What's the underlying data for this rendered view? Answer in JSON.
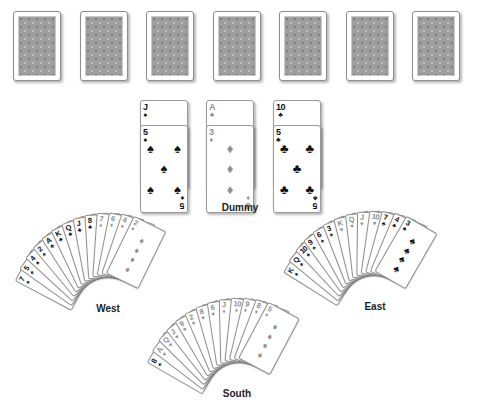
{
  "scene": {
    "title": "Bridge deal layout",
    "background_color": "#ffffff",
    "card_back_color": "#9e9e9e",
    "black_suit_color": "#111111",
    "grey_suit_color": "#909090"
  },
  "suit_glyphs": {
    "spade": "♠",
    "heart": "♥",
    "diamond": "♦",
    "club": "♣"
  },
  "top_row": {
    "name": "face-down-cards",
    "count": 7,
    "cards": [
      {
        "index": 1,
        "face": "down"
      },
      {
        "index": 2,
        "face": "down"
      },
      {
        "index": 3,
        "face": "down"
      },
      {
        "index": 4,
        "face": "down"
      },
      {
        "index": 5,
        "face": "down"
      },
      {
        "index": 6,
        "face": "down"
      },
      {
        "index": 7,
        "face": "down"
      }
    ]
  },
  "dummy": {
    "label": "Dummy",
    "pairs": [
      {
        "back_card": {
          "rank": "J",
          "suit": "spade",
          "color": "black"
        },
        "front_card": {
          "rank": "5",
          "suit": "spade",
          "color": "black",
          "pip_count": 5
        }
      },
      {
        "back_card": {
          "rank": "A",
          "suit": "club",
          "color": "grey"
        },
        "front_card": {
          "rank": "3",
          "suit": "diamond",
          "color": "grey",
          "pip_count": 3
        }
      },
      {
        "back_card": {
          "rank": "10",
          "suit": "club",
          "color": "black"
        },
        "front_card": {
          "rank": "5",
          "suit": "club",
          "color": "black",
          "pip_count": 5
        }
      }
    ]
  },
  "hands": [
    {
      "seat": "West",
      "label": "West",
      "card_count": 13,
      "cards": [
        {
          "rank": "7",
          "suit": "spade",
          "color": "black"
        },
        {
          "rank": "5",
          "suit": "spade",
          "color": "black"
        },
        {
          "rank": "4",
          "suit": "spade",
          "color": "black"
        },
        {
          "rank": "2",
          "suit": "spade",
          "color": "black"
        },
        {
          "rank": "A",
          "suit": "club",
          "color": "black"
        },
        {
          "rank": "K",
          "suit": "club",
          "color": "black"
        },
        {
          "rank": "Q",
          "suit": "club",
          "color": "black"
        },
        {
          "rank": "J",
          "suit": "club",
          "color": "black"
        },
        {
          "rank": "8",
          "suit": "club",
          "color": "black"
        },
        {
          "rank": "7",
          "suit": "diamond",
          "color": "grey"
        },
        {
          "rank": "6",
          "suit": "diamond",
          "color": "grey"
        },
        {
          "rank": "4",
          "suit": "diamond",
          "color": "grey"
        },
        {
          "rank": "2",
          "suit": "diamond",
          "color": "grey"
        }
      ]
    },
    {
      "seat": "East",
      "label": "East",
      "card_count": 13,
      "cards": [
        {
          "rank": "K",
          "suit": "spade",
          "color": "black"
        },
        {
          "rank": "Q",
          "suit": "spade",
          "color": "black"
        },
        {
          "rank": "10",
          "suit": "spade",
          "color": "black"
        },
        {
          "rank": "9",
          "suit": "spade",
          "color": "black"
        },
        {
          "rank": "6",
          "suit": "spade",
          "color": "black"
        },
        {
          "rank": "3",
          "suit": "spade",
          "color": "black"
        },
        {
          "rank": "K",
          "suit": "heart",
          "color": "grey"
        },
        {
          "rank": "Q",
          "suit": "heart",
          "color": "grey"
        },
        {
          "rank": "J",
          "suit": "heart",
          "color": "grey"
        },
        {
          "rank": "10",
          "suit": "heart",
          "color": "grey"
        },
        {
          "rank": "7",
          "suit": "club",
          "color": "black"
        },
        {
          "rank": "4",
          "suit": "club",
          "color": "black"
        },
        {
          "rank": "3",
          "suit": "club",
          "color": "black"
        }
      ]
    },
    {
      "seat": "South",
      "label": "South",
      "card_count": 13,
      "cards": [
        {
          "rank": "8",
          "suit": "spade",
          "color": "black"
        },
        {
          "rank": "A",
          "suit": "heart",
          "color": "grey"
        },
        {
          "rank": "Q",
          "suit": "heart",
          "color": "grey"
        },
        {
          "rank": "J",
          "suit": "heart",
          "color": "grey"
        },
        {
          "rank": "9",
          "suit": "heart",
          "color": "grey"
        },
        {
          "rank": "2",
          "suit": "heart",
          "color": "grey"
        },
        {
          "rank": "8",
          "suit": "heart",
          "color": "grey"
        },
        {
          "rank": "6",
          "suit": "heart",
          "color": "grey"
        },
        {
          "rank": "J",
          "suit": "diamond",
          "color": "grey"
        },
        {
          "rank": "10",
          "suit": "diamond",
          "color": "grey"
        },
        {
          "rank": "9",
          "suit": "diamond",
          "color": "grey"
        },
        {
          "rank": "8",
          "suit": "diamond",
          "color": "grey"
        },
        {
          "rank": "5",
          "suit": "diamond",
          "color": "grey"
        }
      ]
    }
  ]
}
